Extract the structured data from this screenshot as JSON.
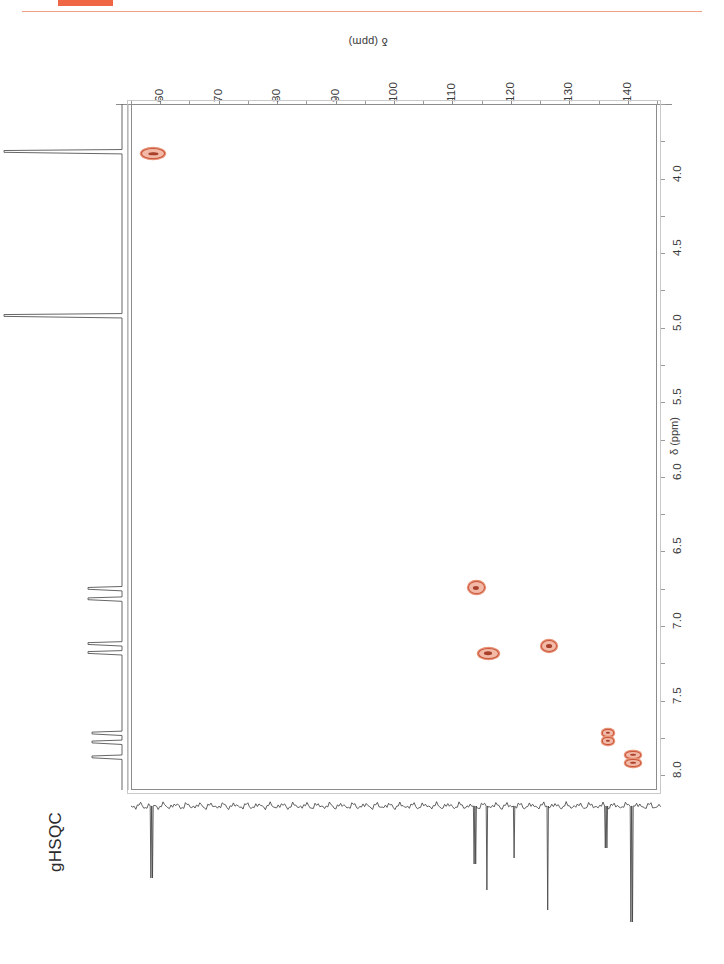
{
  "page": {
    "experiment_title": "gHSQC",
    "accent_color": "#ee6644",
    "rule_color": "#f0a184",
    "contour_color": "#c8543a"
  },
  "axes": {
    "carbon": {
      "label": "δ (ppm)",
      "nucleus": "13C",
      "orientation": "top",
      "direction": "reversed-left-to-right",
      "range": [
        55,
        145
      ],
      "ticks": [
        60,
        70,
        80,
        90,
        100,
        110,
        120,
        130,
        140
      ],
      "tick_labels": [
        "60",
        "70",
        "80",
        "90",
        "100",
        "110",
        "120",
        "130",
        "140"
      ],
      "minor_tick_step": 5
    },
    "proton": {
      "label": "δ (ppm)",
      "nucleus": "1H",
      "orientation": "right",
      "direction": "increasing-downward",
      "range": [
        3.6,
        8.2
      ],
      "ticks": [
        4.0,
        4.5,
        5.0,
        5.5,
        6.0,
        6.5,
        7.0,
        7.5,
        8.0
      ],
      "tick_labels": [
        "4.0",
        "4.5",
        "5.0",
        "5.5",
        "6.0",
        "6.5",
        "7.0",
        "7.5",
        "8.0"
      ],
      "minor_tick_step": 0.25
    }
  },
  "chart_data": {
    "type": "scatter",
    "title": "gHSQC",
    "subtitle": "",
    "xlabel": "δ (ppm)",
    "ylabel": "δ (ppm)",
    "xlim": [
      145,
      55
    ],
    "ylim": [
      8.2,
      3.6
    ],
    "grid": false,
    "legend": null,
    "series": [
      {
        "name": "1H-13C one-bond correlations",
        "points": [
          {
            "id": "peak-ch2-oxy",
            "c_ppm": 58.5,
            "h_ppm": 3.92,
            "shape": "ellipse-wide",
            "w": 22,
            "h": 9
          },
          {
            "id": "peak-aromatic-a",
            "c_ppm": 113.7,
            "h_ppm": 6.83,
            "shape": "ellipse",
            "w": 15,
            "h": 11
          },
          {
            "id": "peak-aromatic-b",
            "c_ppm": 126.2,
            "h_ppm": 7.22,
            "shape": "ellipse",
            "w": 14,
            "h": 10
          },
          {
            "id": "peak-aromatic-c",
            "c_ppm": 115.8,
            "h_ppm": 7.27,
            "shape": "ellipse-wide",
            "w": 19,
            "h": 9
          },
          {
            "id": "peak-aromatic-d",
            "c_ppm": 136.2,
            "h_ppm": 7.83,
            "shape": "ellipse-split",
            "w": 10,
            "h": 13
          },
          {
            "id": "peak-aromatic-e",
            "c_ppm": 140.6,
            "h_ppm": 7.98,
            "shape": "ellipse-split",
            "w": 14,
            "h": 13
          }
        ]
      }
    ],
    "projections": {
      "proton_1d": {
        "axis": "left",
        "peaks_ppm": [
          3.92,
          5.02,
          6.85,
          6.92,
          7.22,
          7.28,
          7.82,
          7.88,
          7.98
        ],
        "tall_peaks_ppm": [
          3.92,
          5.02
        ]
      },
      "carbon_1d": {
        "axis": "bottom",
        "direction": "downward",
        "peaks_ppm": [
          58.5,
          113.7,
          115.8,
          120.4,
          126.2,
          136.2,
          140.6
        ],
        "noise": true
      }
    }
  }
}
